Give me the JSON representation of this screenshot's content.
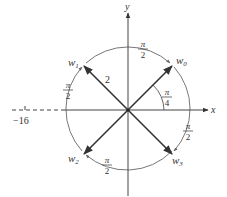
{
  "diagram": {
    "type": "complex-roots-diagram",
    "axes": {
      "x_label": "x",
      "y_label": "y"
    },
    "radius_label": "2",
    "angle_label": {
      "num": "π",
      "den": "4"
    },
    "neg_tick_label": "−16",
    "roots": [
      {
        "name": "w",
        "sub": "0"
      },
      {
        "name": "w",
        "sub": "1"
      },
      {
        "name": "w",
        "sub": "2"
      },
      {
        "name": "w",
        "sub": "3"
      }
    ],
    "arc_labels": [
      {
        "num": "π",
        "den": "2"
      },
      {
        "num": "π",
        "den": "2"
      },
      {
        "num": "π",
        "den": "2"
      },
      {
        "num": "π",
        "den": "2"
      }
    ],
    "colors": {
      "axis": "#444444",
      "vector": "#333333",
      "circle": "#777777"
    }
  }
}
